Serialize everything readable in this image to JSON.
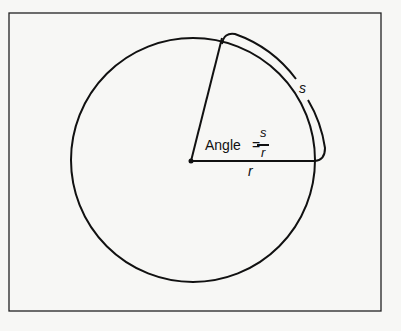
{
  "diagram": {
    "angle_label": "Angle",
    "equals": "=",
    "numerator": "s",
    "denominator": "r",
    "arc_label": "s",
    "radius_label": "r",
    "stroke_color": "#111111",
    "background_color": "#f7f7f5"
  }
}
